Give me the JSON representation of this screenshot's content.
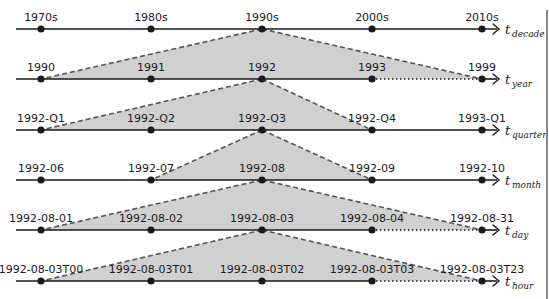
{
  "diagram": {
    "colors": {
      "line": "#1a1a1a",
      "fill": "#d0d0d0",
      "dash": "#555555",
      "border": "#8a8a8a"
    },
    "axes": [
      {
        "symbol": "t",
        "subscript": "decade",
        "labels": [
          "1970s",
          "1980s",
          "1990s",
          "2000s",
          "2010s"
        ],
        "last_segment_dotted": false
      },
      {
        "symbol": "t",
        "subscript": "year",
        "labels": [
          "1990",
          "1991",
          "1992",
          "1993",
          "1999"
        ],
        "last_segment_dotted": true
      },
      {
        "symbol": "t",
        "subscript": "quarter",
        "labels": [
          "1992-Q1",
          "1992-Q2",
          "1992-Q3",
          "1992-Q4",
          "1993-Q1"
        ],
        "last_segment_dotted": false
      },
      {
        "symbol": "t",
        "subscript": "month",
        "labels": [
          "1992-06",
          "1992-07",
          "1992-08",
          "1992-09",
          "1992-10"
        ],
        "last_segment_dotted": false
      },
      {
        "symbol": "t",
        "subscript": "day",
        "labels": [
          "1992-08-01",
          "1992-08-02",
          "1992-08-03",
          "1992-08-04",
          "1992-08-31"
        ],
        "last_segment_dotted": true
      },
      {
        "symbol": "t",
        "subscript": "hour",
        "labels": [
          "1992-08-03T00",
          "1992-08-03T01",
          "1992-08-03T02",
          "1992-08-03T03",
          "1992-08-03T23"
        ],
        "last_segment_dotted": true
      }
    ],
    "zoom_cones": [
      {
        "from_axis": 0,
        "apex_point": 2,
        "to_axis": 1,
        "base_from_point": 0,
        "base_to_point": 4
      },
      {
        "from_axis": 1,
        "apex_point": 2,
        "to_axis": 2,
        "base_from_point": 0,
        "base_to_point": 3
      },
      {
        "from_axis": 2,
        "apex_point": 2,
        "to_axis": 3,
        "base_from_point": 1,
        "base_to_point": 3
      },
      {
        "from_axis": 3,
        "apex_point": 2,
        "to_axis": 4,
        "base_from_point": 0,
        "base_to_point": 4
      },
      {
        "from_axis": 4,
        "apex_point": 2,
        "to_axis": 5,
        "base_from_point": 0,
        "base_to_point": 4
      }
    ]
  }
}
